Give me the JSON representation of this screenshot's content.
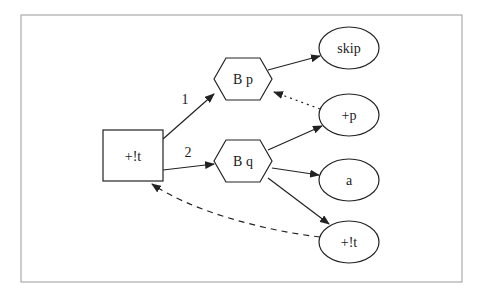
{
  "diagram": {
    "frame": {
      "x": 21,
      "y": 15,
      "width": 441,
      "height": 267,
      "stroke": "#9a9a9a"
    },
    "colors": {
      "stroke": "#222222",
      "fill": "#ffffff",
      "text": "#1a1a1a"
    },
    "nodes": [
      {
        "id": "root",
        "label": "+!t",
        "shape": "box",
        "cx": 133,
        "cy": 156,
        "w": 60,
        "h": 51
      },
      {
        "id": "bp",
        "label": "B p",
        "shape": "hexagon",
        "cx": 243,
        "cy": 79,
        "w": 58,
        "h": 42
      },
      {
        "id": "bq",
        "label": "B q",
        "shape": "hexagon",
        "cx": 243,
        "cy": 161,
        "w": 58,
        "h": 42
      },
      {
        "id": "skip",
        "label": "skip",
        "shape": "ellipse",
        "cx": 349,
        "cy": 48,
        "rx": 30,
        "ry": 21
      },
      {
        "id": "plusp",
        "label": "+p",
        "shape": "ellipse",
        "cx": 349,
        "cy": 115,
        "rx": 30,
        "ry": 21
      },
      {
        "id": "a",
        "label": "a",
        "shape": "ellipse",
        "cx": 349,
        "cy": 180,
        "rx": 30,
        "ry": 21
      },
      {
        "id": "plust",
        "label": "+!t",
        "shape": "ellipse",
        "cx": 349,
        "cy": 242,
        "rx": 30,
        "ry": 21
      }
    ],
    "edges": [
      {
        "from": "root",
        "to": "bp",
        "label": "1",
        "style": "solid"
      },
      {
        "from": "root",
        "to": "bq",
        "label": "2",
        "style": "solid"
      },
      {
        "from": "bp",
        "to": "skip",
        "label": "",
        "style": "solid"
      },
      {
        "from": "plusp",
        "to": "bp",
        "label": "",
        "style": "dotted"
      },
      {
        "from": "bq",
        "to": "plusp",
        "label": "",
        "style": "solid"
      },
      {
        "from": "bq",
        "to": "a",
        "label": "",
        "style": "solid"
      },
      {
        "from": "bq",
        "to": "plust",
        "label": "",
        "style": "solid"
      },
      {
        "from": "plust",
        "to": "root",
        "label": "",
        "style": "dashed"
      }
    ]
  }
}
